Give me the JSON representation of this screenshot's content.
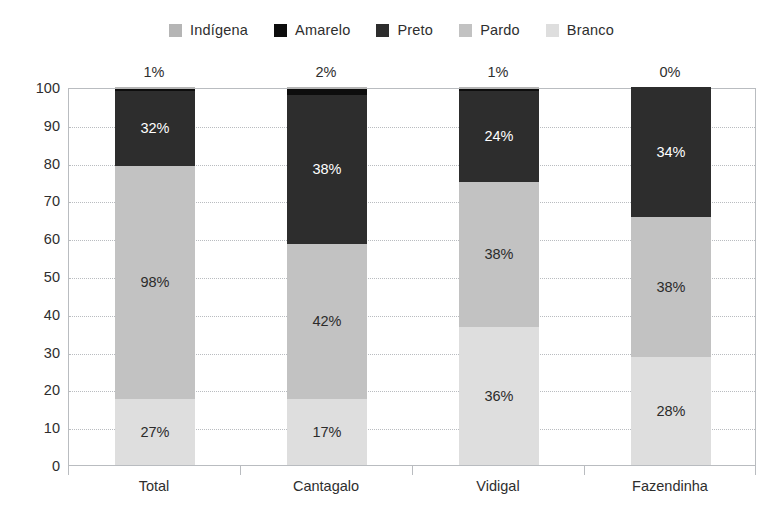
{
  "chart_data": {
    "type": "bar",
    "subtype": "stacked-bar-100",
    "title": "",
    "subtitle": "",
    "xlabel": "",
    "ylabel": "",
    "ylim": [
      0,
      100
    ],
    "yticks": [
      0,
      10,
      20,
      30,
      40,
      50,
      60,
      70,
      80,
      90,
      100
    ],
    "ytick_labels": [
      "0",
      "10",
      "20",
      "30",
      "40",
      "50",
      "60",
      "70",
      "80",
      "90",
      "100"
    ],
    "grid": true,
    "legend_position": "top-center",
    "categories": [
      "Total",
      "Cantagalo",
      "Vidigal",
      "Fazendinha"
    ],
    "series": [
      {
        "name": "Branco",
        "color": "#dedede",
        "values": [
          17.5,
          17.5,
          36.5,
          28.5
        ],
        "labels": [
          "27%",
          "17%",
          "36%",
          "28%"
        ],
        "label_style": "on-light"
      },
      {
        "name": "Pardo",
        "color": "#c2c2c2",
        "values": [
          61.5,
          41.0,
          38.5,
          37.0
        ],
        "labels": [
          "98%",
          "42%",
          "38%",
          "38%"
        ],
        "label_style": "on-light"
      },
      {
        "name": "Preto",
        "color": "#2d2d2d",
        "values": [
          20.0,
          39.5,
          24.0,
          34.5
        ],
        "labels": [
          "32%",
          "38%",
          "24%",
          "34%"
        ],
        "label_style": "on-dark"
      },
      {
        "name": "Amarelo",
        "color": "#0d0d0d",
        "values": [
          0.6,
          1.6,
          0.6,
          0.0
        ],
        "labels": [
          "",
          "",
          "",
          ""
        ],
        "label_style": "on-dark"
      },
      {
        "name": "Indígena",
        "color": "#b5b5b5",
        "values": [
          0.4,
          0.4,
          0.4,
          0.0
        ],
        "labels": [
          "",
          "",
          "",
          ""
        ],
        "label_style": "on-light"
      }
    ],
    "top_labels": [
      "1%",
      "2%",
      "1%",
      "0%"
    ],
    "legend": [
      {
        "label": "Indígena",
        "color": "#b5b5b5"
      },
      {
        "label": "Amarelo",
        "color": "#0d0d0d"
      },
      {
        "label": "Preto",
        "color": "#2d2d2d"
      },
      {
        "label": "Pardo",
        "color": "#c2c2c2"
      },
      {
        "label": "Branco",
        "color": "#dedede"
      }
    ]
  },
  "colors": {
    "background": "#ffffff",
    "axis": "#b9bcc0",
    "grid": "#b9bcc0",
    "text": "#2e2e2e"
  }
}
